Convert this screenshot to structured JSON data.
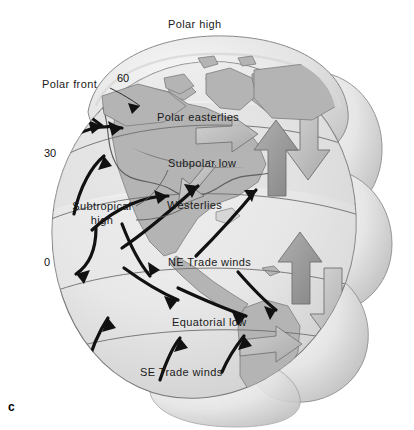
{
  "figure": {
    "panel_letter": "c",
    "title_label": "Polar high",
    "background_color": "#ffffff"
  },
  "colors": {
    "ocean": "#e9e9e9",
    "land": "#b4b4b4",
    "land_dark": "#9a9a9a",
    "cell_arrow_fill": "#c9c9c9",
    "cell_arrow_stroke": "#6f6f6f",
    "outline": "#6a6a6a",
    "wind_arrow": "#111111",
    "text": "#1a1a1a",
    "lobe_light": "#f2f2f2",
    "lobe_shadow": "#c4c4c4"
  },
  "labels": {
    "polar_high": "Polar high",
    "polar_front": "Polar front",
    "polar_easterlies": "Polar easterlies",
    "subpolar_low": "Subpolar low",
    "westerlies": "Westerlies",
    "subtropical_high_line1": "Subtropical",
    "subtropical_high_line2": "high",
    "ne_trade_winds": "NE Trade winds",
    "equatorial_low": "Equatorial   low",
    "se_trade_winds": "SE Trade winds"
  },
  "latitude_ticks": [
    {
      "name": "latitude-60",
      "value": "60"
    },
    {
      "name": "latitude-30",
      "value": "30"
    },
    {
      "name": "latitude-0",
      "value": "0"
    }
  ],
  "wind_belts": [
    {
      "name": "polar-easterlies",
      "label": "Polar easterlies",
      "latitude_range": "60-90"
    },
    {
      "name": "westerlies",
      "label": "Westerlies",
      "latitude_range": "30-60"
    },
    {
      "name": "ne-trade-winds",
      "label": "NE Trade winds",
      "latitude_range": "0-30"
    },
    {
      "name": "se-trade-winds",
      "label": "SE Trade winds",
      "latitude_range": "0-30 S"
    }
  ],
  "pressure_zones": [
    {
      "name": "polar-high",
      "label": "Polar high"
    },
    {
      "name": "subpolar-low",
      "label": "Subpolar low"
    },
    {
      "name": "subtropical-high",
      "label": "Subtropical high"
    },
    {
      "name": "equatorial-low",
      "label": "Equatorial   low"
    }
  ],
  "boundaries": [
    {
      "name": "polar-front",
      "label": "Polar front"
    }
  ]
}
